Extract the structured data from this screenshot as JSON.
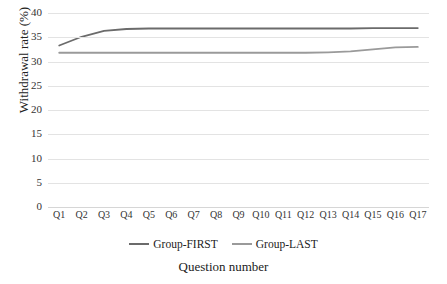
{
  "chart_data": {
    "type": "line",
    "title": "",
    "xlabel": "Question number",
    "ylabel": "Withdrawal rate (%)",
    "categories": [
      "Q1",
      "Q2",
      "Q3",
      "Q4",
      "Q5",
      "Q6",
      "Q7",
      "Q8",
      "Q9",
      "Q10",
      "Q11",
      "Q12",
      "Q13",
      "Q14",
      "Q15",
      "Q16",
      "Q17"
    ],
    "yticks": [
      0,
      5,
      10,
      15,
      20,
      25,
      30,
      35,
      40
    ],
    "ylim": [
      0,
      40
    ],
    "grid": true,
    "legend_position": "bottom",
    "series": [
      {
        "name": "Group-FIRST",
        "color": "#6b6b6b",
        "values": [
          33.3,
          35.1,
          36.3,
          36.7,
          36.8,
          36.8,
          36.8,
          36.8,
          36.8,
          36.8,
          36.8,
          36.8,
          36.8,
          36.8,
          36.9,
          36.9,
          36.9
        ]
      },
      {
        "name": "Group-LAST",
        "color": "#9a9a9a",
        "values": [
          31.8,
          31.8,
          31.8,
          31.8,
          31.8,
          31.8,
          31.8,
          31.8,
          31.8,
          31.8,
          31.8,
          31.8,
          31.9,
          32.1,
          32.5,
          32.9,
          33.0
        ]
      }
    ]
  },
  "axis": {
    "ylabel": "Withdrawal rate (%)",
    "xlabel": "Question number"
  },
  "legend": {
    "items": [
      {
        "label": "Group-FIRST",
        "color": "#6b6b6b"
      },
      {
        "label": "Group-LAST",
        "color": "#9a9a9a"
      }
    ]
  }
}
